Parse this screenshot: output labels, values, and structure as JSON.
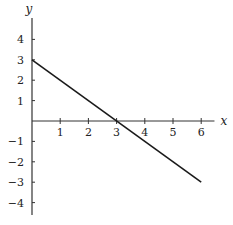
{
  "chart_data": {
    "type": "line",
    "title": "",
    "xlabel": "x",
    "ylabel": "y",
    "xlim": [
      0,
      6.4
    ],
    "ylim": [
      -4.5,
      4.5
    ],
    "grid": false,
    "legend": null,
    "x_ticks": [
      1,
      2,
      3,
      4,
      5,
      6
    ],
    "y_ticks": [
      4,
      3,
      2,
      1,
      -1,
      -2,
      -3,
      -4
    ],
    "x_tick_labels": [
      "1",
      "2",
      "3",
      "4",
      "5",
      "6"
    ],
    "y_tick_labels": [
      "4",
      "3",
      "2",
      "1",
      "−1",
      "−2",
      "−3",
      "−4"
    ],
    "series": [
      {
        "name": "line",
        "x": [
          0,
          6
        ],
        "y": [
          3,
          -3
        ],
        "color": "#1a1a1a"
      }
    ],
    "annotations": []
  },
  "layout": {
    "origin_px": [
      32,
      121
    ],
    "x_unit_px": 28.2,
    "y_unit_px": 20.4,
    "axis_color": "#333333",
    "line_color": "#1a1a1a"
  }
}
